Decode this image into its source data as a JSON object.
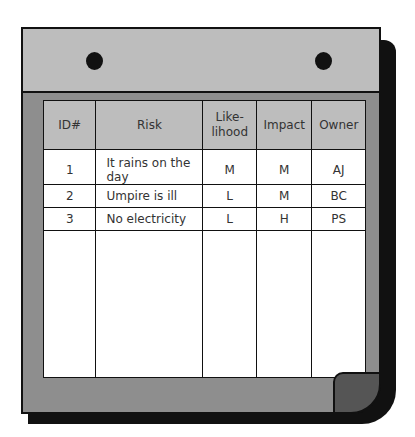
{
  "table": {
    "headers": [
      "ID#",
      "Risk",
      "Like-\nlihood",
      "Impact",
      "Owner"
    ],
    "header_likelihood_line1": "Like-",
    "header_likelihood_line2": "lihood",
    "rows": [
      {
        "id": "1",
        "risk": "It rains on the day",
        "likelihood": "M",
        "impact": "M",
        "owner": "AJ"
      },
      {
        "id": "2",
        "risk": "Umpire is ill",
        "likelihood": "L",
        "impact": "M",
        "owner": "BC"
      },
      {
        "id": "3",
        "risk": "No electricity",
        "likelihood": "L",
        "impact": "H",
        "owner": "PS"
      }
    ]
  },
  "colors": {
    "strip": "#bdbdbd",
    "frame": "#8e8e8e",
    "outline": "#111111",
    "cell": "#ffffff"
  }
}
